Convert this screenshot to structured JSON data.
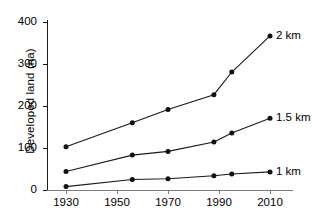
{
  "chart_data": {
    "type": "line",
    "title": "",
    "xlabel": "",
    "ylabel": "Developed land (ha)",
    "xlim": [
      1925,
      2015
    ],
    "ylim": [
      0,
      400
    ],
    "grid": false,
    "legend_position": "right-inline-at-line-end",
    "x_ticks": [
      1930,
      1950,
      1970,
      1990,
      2010
    ],
    "y_ticks": [
      0,
      100,
      200,
      300,
      400
    ],
    "x": [
      1930,
      1956,
      1970,
      1988,
      1995,
      2010
    ],
    "series": [
      {
        "name": "2 km",
        "values": [
          103,
          160,
          192,
          227,
          281,
          367
        ]
      },
      {
        "name": "1.5 km",
        "values": [
          44,
          83,
          92,
          114,
          136,
          171
        ]
      },
      {
        "name": "1 km",
        "values": [
          8,
          25,
          27,
          34,
          38,
          43
        ]
      }
    ],
    "marker": "filled-circle",
    "line_color": "#1a1a1a"
  },
  "axis": {
    "y_tick_labels": [
      "0",
      "100",
      "200",
      "300",
      "400"
    ],
    "x_tick_labels": [
      "1930",
      "1950",
      "1970",
      "1990",
      "2010"
    ],
    "y_title": "Developed land (ha)"
  },
  "labels": {
    "s0": "2 km",
    "s1": "1.5 km",
    "s2": "1 km"
  }
}
